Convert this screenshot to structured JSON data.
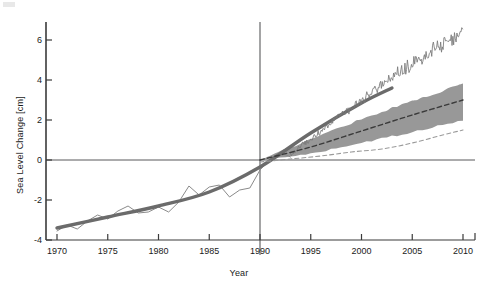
{
  "figure": {
    "xlabel": "Year",
    "ylabel": "Sea Level Change [cm]"
  },
  "chart_data": {
    "type": "line",
    "title": "",
    "subtitle": "",
    "xlabel": "Year",
    "ylabel": "Sea Level Change [cm]",
    "xlim": [
      1970,
      2010
    ],
    "ylim": [
      -4.3,
      6.8
    ],
    "xticks": [
      1970,
      1975,
      1980,
      1985,
      1990,
      1995,
      2000,
      2005,
      2010
    ],
    "yticks": [
      -4,
      -2,
      0,
      2,
      4,
      6
    ],
    "grid": false,
    "legend": "none",
    "annotations": [
      {
        "name": "zero-reference-line",
        "type": "hline",
        "y": 0
      },
      {
        "name": "baseline-year-line",
        "type": "vline",
        "x": 1990
      }
    ],
    "series": [
      {
        "name": "observed-tide-gauge",
        "style": "thin-solid",
        "color": "#8a8a8a",
        "x": [
          1970,
          1971,
          1972,
          1973,
          1974,
          1975,
          1976,
          1977,
          1978,
          1979,
          1980,
          1981,
          1982,
          1983,
          1984,
          1985,
          1986,
          1987,
          1988,
          1989,
          1990,
          1991,
          1992,
          1993
        ],
        "values": [
          -3.55,
          -3.25,
          -3.45,
          -3.05,
          -2.75,
          -2.95,
          -2.55,
          -2.3,
          -2.65,
          -2.6,
          -2.35,
          -2.6,
          -2.1,
          -1.3,
          -1.75,
          -1.35,
          -1.25,
          -1.85,
          -1.5,
          -1.4,
          -0.5,
          0.05,
          0.4,
          0.15
        ]
      },
      {
        "name": "smoothed-reconstruction",
        "style": "thick-solid",
        "color": "#6b6b6b",
        "x": [
          1970,
          1975,
          1980,
          1985,
          1990,
          1995,
          2000,
          2003
        ],
        "values": [
          -3.4,
          -2.85,
          -2.3,
          -1.6,
          -0.35,
          1.35,
          2.85,
          3.6
        ]
      },
      {
        "name": "satellite-altimetry",
        "style": "noisy-solid",
        "color": "#787878",
        "x": [
          1993,
          1994,
          1995,
          1996,
          1997,
          1998,
          1999,
          2000,
          2001,
          2002,
          2003,
          2004,
          2005,
          2006,
          2007,
          2008,
          2009,
          2010
        ],
        "values": [
          0.25,
          0.7,
          1.05,
          1.45,
          1.95,
          2.35,
          2.5,
          3.0,
          3.35,
          3.75,
          4.1,
          4.5,
          4.8,
          5.15,
          5.5,
          5.8,
          6.05,
          6.35
        ]
      },
      {
        "name": "projection-central-estimate",
        "style": "dashed",
        "color": "#3a3a3a",
        "x": [
          1990,
          1995,
          2000,
          2005,
          2010
        ],
        "values": [
          0.0,
          0.65,
          1.45,
          2.25,
          3.0
        ]
      },
      {
        "name": "projection-lower-bound",
        "style": "dashed-thin",
        "color": "#9a9a9a",
        "x": [
          1990,
          1993,
          1996,
          1999,
          2002,
          2005,
          2008,
          2010
        ],
        "values": [
          -0.1,
          0.05,
          0.2,
          0.4,
          0.55,
          0.85,
          1.25,
          1.5
        ]
      }
    ],
    "band": {
      "name": "projection-uncertainty-range",
      "color": "#8f8f8f",
      "x": [
        1990,
        1995,
        2000,
        2005,
        2010
      ],
      "lower": [
        0.0,
        0.3,
        0.85,
        1.4,
        2.0
      ],
      "upper": [
        0.0,
        1.05,
        2.05,
        2.95,
        3.8
      ]
    }
  }
}
